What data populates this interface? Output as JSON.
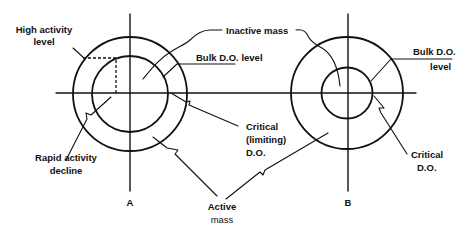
{
  "diagram": {
    "type": "floc-oxygen-profile-schematic",
    "colors": {
      "ink": "#111111",
      "background": "#ffffff"
    },
    "panels": [
      {
        "id": "A",
        "label": "A",
        "annotations": {
          "high_activity": [
            "High activity",
            "level"
          ],
          "inactive_mass": "Inactive mass",
          "bulk_do": "Bulk D.O. level",
          "critical": [
            "Critical",
            "(limiting)",
            "D.O."
          ],
          "rapid_decline": [
            "Rapid activity",
            "decline"
          ]
        }
      },
      {
        "id": "B",
        "label": "B",
        "annotations": {
          "bulk_do": [
            "Bulk D.O.",
            "level"
          ],
          "critical": [
            "Critical",
            "D.O."
          ]
        }
      }
    ],
    "shared": {
      "active_mass": [
        "Active",
        "mass"
      ]
    }
  }
}
